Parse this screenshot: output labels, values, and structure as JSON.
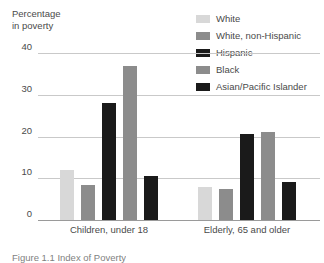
{
  "chart_data": {
    "type": "bar",
    "title": "",
    "ylabel": "Percentage\nin poverty",
    "xlabel": "",
    "ylim": [
      0,
      40
    ],
    "yticks": [
      0,
      10,
      20,
      30,
      40
    ],
    "ytick_labels": [
      "0",
      "10",
      "20",
      "30",
      "40"
    ],
    "grid": true,
    "legend_position": "top-right",
    "categories": [
      "Children, under 18",
      "Elderly, 65 and older"
    ],
    "series": [
      {
        "name": "White",
        "color": "#d8d8d8",
        "values": [
          12.0,
          8.0
        ]
      },
      {
        "name": "White, non-Hispanic",
        "color": "#8c8c8c",
        "values": [
          8.5,
          7.5
        ]
      },
      {
        "name": "Hispanic",
        "color": "#1a1a1a",
        "values": [
          28.0,
          20.5
        ]
      },
      {
        "name": "Black",
        "color": "#8c8c8c",
        "values": [
          37.0,
          21.0
        ]
      },
      {
        "name": "Asian/Pacific Islander",
        "color": "#1a1a1a",
        "values": [
          10.5,
          9.0
        ]
      }
    ]
  },
  "caption": "Figure 1.1  Index of Poverty"
}
